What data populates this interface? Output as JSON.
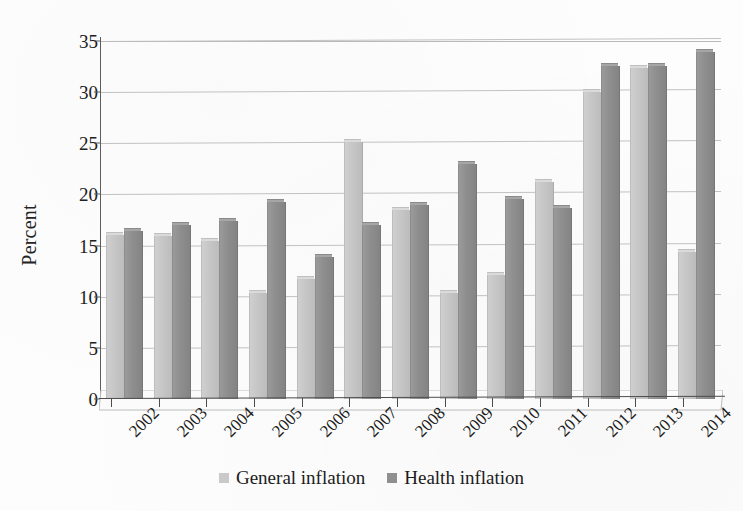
{
  "chart_data": {
    "type": "bar",
    "title": "",
    "subtitle": "",
    "xlabel": "",
    "ylabel": "Percent",
    "ylim": [
      0,
      35
    ],
    "ytick_step": 5,
    "yticks": [
      "0",
      "5",
      "10",
      "15",
      "20",
      "25",
      "30",
      "35"
    ],
    "grid": true,
    "grid_axis": "y",
    "legend_position": "bottom-center",
    "orientation": "vertical",
    "grouping": "clustered",
    "style": "3d-column-grayscale",
    "categories": [
      "2002",
      "2003",
      "2004",
      "2005",
      "2006",
      "2007",
      "2008",
      "2009",
      "2010",
      "2011",
      "2012",
      "2013",
      "2014"
    ],
    "series": [
      {
        "name": "General inflation",
        "color": "#c6c6c6",
        "values": [
          16.0,
          15.9,
          15.4,
          10.4,
          11.7,
          25.1,
          18.5,
          10.4,
          12.1,
          21.2,
          30.0,
          32.4,
          14.4
        ]
      },
      {
        "name": "Health inflation",
        "color": "#8e8e8e",
        "values": [
          16.4,
          17.0,
          17.4,
          19.3,
          13.9,
          17.0,
          19.0,
          23.0,
          19.6,
          18.7,
          32.6,
          32.6,
          33.9
        ]
      }
    ]
  },
  "legend": {
    "items": [
      {
        "label": "General inflation",
        "swatch": "general",
        "icon": "legend-swatch-icon"
      },
      {
        "label": "Health inflation",
        "swatch": "health",
        "icon": "legend-swatch-icon"
      }
    ]
  },
  "axes": {
    "y_title": "Percent"
  }
}
